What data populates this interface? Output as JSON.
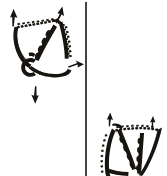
{
  "figure": {
    "kind": "line-drawing",
    "background_color": "#ffffff",
    "ink_color": "#18140f",
    "width": 167,
    "height": 176,
    "title": "",
    "caption": "",
    "panels": [
      {
        "id": "panel-left",
        "position": "upper-left",
        "label": "",
        "description": "Triangular bone element in oblique view with stippled dorsal suture margin and a C-shaped foramen in the lower body"
      },
      {
        "id": "panel-right",
        "position": "lower-right",
        "label": "",
        "description": "Second view of the same bone element, cropped by the image edge, with stippled dorsal suture margin"
      }
    ],
    "divider": {
      "id": "panel-divider",
      "orientation": "vertical",
      "x": 86,
      "y_start": 2,
      "y_end": 176,
      "thickness": 1.6,
      "color": "#18140f"
    },
    "annotations": [
      {
        "id": "arrow-up-left",
        "glyph": "arrow-up",
        "direction": "up",
        "label": "",
        "x": 14,
        "y": 16
      },
      {
        "id": "arrow-up-middle",
        "glyph": "arrow-up",
        "direction": "up",
        "label": "",
        "x": 60,
        "y": 14
      },
      {
        "id": "arrow-right",
        "glyph": "arrow-right",
        "direction": "right",
        "label": "",
        "x": 78,
        "y": 65
      },
      {
        "id": "arrow-down",
        "glyph": "arrow-down",
        "direction": "down",
        "label": "",
        "x": 36,
        "y": 98
      },
      {
        "id": "arrow-up-right-a",
        "glyph": "arrow-up",
        "direction": "up",
        "label": "",
        "x": 110,
        "y": 118
      },
      {
        "id": "arrow-up-right-b",
        "glyph": "arrow-up",
        "direction": "up",
        "label": "",
        "x": 152,
        "y": 120
      }
    ]
  }
}
